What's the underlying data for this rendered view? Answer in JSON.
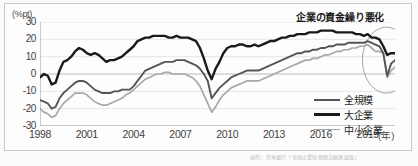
{
  "chart_data": {
    "type": "line",
    "title": "",
    "xlabel": "年",
    "ylabel": "%pt",
    "unit_label": "(%pt)",
    "x_unit_label": "(年)",
    "xlim": [
      1998,
      2020.75
    ],
    "ylim": [
      -30,
      30
    ],
    "ytick_values": [
      30,
      20,
      10,
      0,
      -10,
      -20,
      -30
    ],
    "ytick_labels": [
      "30",
      "20",
      "10",
      "0",
      "-10",
      "-20",
      "-30"
    ],
    "xtick_values": [
      1998,
      2001,
      2004,
      2007,
      2010,
      2013,
      2016,
      2019
    ],
    "xtick_labels": [
      "1998",
      "2001",
      "2004",
      "2007",
      "2010",
      "2013",
      "2016",
      "2019"
    ],
    "grid": true,
    "grid_axis": "y",
    "legend_position": "bottom-right",
    "annotations": [
      {
        "text": "企業の資金繰り悪化",
        "type": "ellipse-callout",
        "target_x": 2020.2,
        "target_y": 8
      }
    ],
    "series": [
      {
        "name": "全規模",
        "color": "#555555",
        "width": 1.9,
        "x": [
          1998.0,
          1998.25,
          1998.5,
          1998.75,
          1999.0,
          1999.25,
          1999.5,
          1999.75,
          2000.0,
          2000.25,
          2000.5,
          2000.75,
          2001.0,
          2001.25,
          2001.5,
          2001.75,
          2002.0,
          2002.25,
          2002.5,
          2002.75,
          2003.0,
          2003.25,
          2003.5,
          2003.75,
          2004.0,
          2004.25,
          2004.5,
          2004.75,
          2005.0,
          2005.25,
          2005.5,
          2005.75,
          2006.0,
          2006.25,
          2006.5,
          2006.75,
          2007.0,
          2007.25,
          2007.5,
          2007.75,
          2008.0,
          2008.25,
          2008.5,
          2008.75,
          2009.0,
          2009.25,
          2009.5,
          2009.75,
          2010.0,
          2010.25,
          2010.5,
          2010.75,
          2011.0,
          2011.25,
          2011.5,
          2011.75,
          2012.0,
          2012.25,
          2012.5,
          2012.75,
          2013.0,
          2013.25,
          2013.5,
          2013.75,
          2014.0,
          2014.25,
          2014.5,
          2014.75,
          2015.0,
          2015.25,
          2015.5,
          2015.75,
          2016.0,
          2016.25,
          2016.5,
          2016.75,
          2017.0,
          2017.25,
          2017.5,
          2017.75,
          2018.0,
          2018.25,
          2018.5,
          2018.75,
          2019.0,
          2019.25,
          2019.5,
          2019.75,
          2020.0,
          2020.25,
          2020.5,
          2020.75
        ],
        "y": [
          -15,
          -16,
          -17,
          -20,
          -19,
          -14,
          -11,
          -9,
          -7,
          -5,
          -4,
          -4,
          -5,
          -7,
          -9,
          -10,
          -11,
          -11,
          -11,
          -10,
          -10,
          -9,
          -9,
          -9,
          -7,
          -4,
          -1,
          2,
          3,
          4,
          5,
          6,
          7,
          7,
          7,
          8,
          8,
          8,
          7,
          6,
          5,
          3,
          0,
          -4,
          -14,
          -11,
          -8,
          -6,
          -4,
          -2,
          -1,
          0,
          1,
          2,
          2,
          2,
          2,
          3,
          4,
          5,
          6,
          7,
          8,
          9,
          10,
          11,
          12,
          12,
          13,
          13,
          14,
          14,
          15,
          15,
          16,
          16,
          17,
          17,
          17,
          18,
          18,
          18,
          18,
          18,
          19,
          18,
          17,
          16,
          12,
          -1,
          6,
          8
        ]
      },
      {
        "name": "大企業",
        "color": "#1a1a1a",
        "width": 2.4,
        "x": [
          1998.0,
          1998.25,
          1998.5,
          1998.75,
          1999.0,
          1999.25,
          1999.5,
          1999.75,
          2000.0,
          2000.25,
          2000.5,
          2000.75,
          2001.0,
          2001.25,
          2001.5,
          2001.75,
          2002.0,
          2002.25,
          2002.5,
          2002.75,
          2003.0,
          2003.25,
          2003.5,
          2003.75,
          2004.0,
          2004.25,
          2004.5,
          2004.75,
          2005.0,
          2005.25,
          2005.5,
          2005.75,
          2006.0,
          2006.25,
          2006.5,
          2006.75,
          2007.0,
          2007.25,
          2007.5,
          2007.75,
          2008.0,
          2008.25,
          2008.5,
          2008.75,
          2009.0,
          2009.25,
          2009.5,
          2009.75,
          2010.0,
          2010.25,
          2010.5,
          2010.75,
          2011.0,
          2011.25,
          2011.5,
          2011.75,
          2012.0,
          2012.25,
          2012.5,
          2012.75,
          2013.0,
          2013.25,
          2013.5,
          2013.75,
          2014.0,
          2014.25,
          2014.5,
          2014.75,
          2015.0,
          2015.25,
          2015.5,
          2015.75,
          2016.0,
          2016.25,
          2016.5,
          2016.75,
          2017.0,
          2017.25,
          2017.5,
          2017.75,
          2018.0,
          2018.25,
          2018.5,
          2018.75,
          2019.0,
          2019.25,
          2019.5,
          2019.75,
          2020.0,
          2020.25,
          2020.5,
          2020.75
        ],
        "y": [
          -2,
          0,
          -1,
          -6,
          -5,
          2,
          7,
          8,
          10,
          13,
          15,
          14,
          12,
          11,
          12,
          11,
          9,
          7,
          8,
          8,
          9,
          10,
          12,
          14,
          16,
          19,
          20,
          21,
          21,
          22,
          22,
          22,
          22,
          21,
          21,
          22,
          21,
          21,
          21,
          20,
          19,
          15,
          9,
          2,
          -3,
          3,
          7,
          12,
          15,
          16,
          16,
          17,
          17,
          16,
          16,
          17,
          16,
          17,
          18,
          19,
          19,
          20,
          21,
          21,
          22,
          22,
          23,
          23,
          23,
          24,
          24,
          24,
          25,
          25,
          25,
          25,
          24,
          24,
          24,
          24,
          24,
          23,
          23,
          22,
          23,
          21,
          21,
          20,
          16,
          11,
          12,
          12
        ]
      },
      {
        "name": "中小企業",
        "color": "#a8a8a8",
        "width": 1.7,
        "x": [
          1998.0,
          1998.25,
          1998.5,
          1998.75,
          1999.0,
          1999.25,
          1999.5,
          1999.75,
          2000.0,
          2000.25,
          2000.5,
          2000.75,
          2001.0,
          2001.25,
          2001.5,
          2001.75,
          2002.0,
          2002.25,
          2002.5,
          2002.75,
          2003.0,
          2003.25,
          2003.5,
          2003.75,
          2004.0,
          2004.25,
          2004.5,
          2004.75,
          2005.0,
          2005.25,
          2005.5,
          2005.75,
          2006.0,
          2006.25,
          2006.5,
          2006.75,
          2007.0,
          2007.25,
          2007.5,
          2007.75,
          2008.0,
          2008.25,
          2008.5,
          2008.75,
          2009.0,
          2009.25,
          2009.5,
          2009.75,
          2010.0,
          2010.25,
          2010.5,
          2010.75,
          2011.0,
          2011.25,
          2011.5,
          2011.75,
          2012.0,
          2012.25,
          2012.5,
          2012.75,
          2013.0,
          2013.25,
          2013.5,
          2013.75,
          2014.0,
          2014.25,
          2014.5,
          2014.75,
          2015.0,
          2015.25,
          2015.5,
          2015.75,
          2016.0,
          2016.25,
          2016.5,
          2016.75,
          2017.0,
          2017.25,
          2017.5,
          2017.75,
          2018.0,
          2018.25,
          2018.5,
          2018.75,
          2019.0,
          2019.25,
          2019.5,
          2019.75,
          2020.0,
          2020.25,
          2020.5,
          2020.75
        ],
        "y": [
          -20,
          -22,
          -23,
          -25,
          -24,
          -20,
          -17,
          -15,
          -13,
          -11,
          -11,
          -11,
          -12,
          -14,
          -16,
          -17,
          -18,
          -18,
          -17,
          -16,
          -15,
          -14,
          -12,
          -11,
          -9,
          -7,
          -5,
          -3,
          -2,
          -1,
          0,
          0,
          1,
          1,
          0,
          0,
          0,
          0,
          -1,
          -2,
          -4,
          -7,
          -12,
          -17,
          -22,
          -19,
          -15,
          -12,
          -10,
          -8,
          -7,
          -6,
          -5,
          -4,
          -4,
          -4,
          -4,
          -3,
          -2,
          -1,
          0,
          1,
          2,
          3,
          4,
          5,
          6,
          7,
          8,
          8,
          9,
          9,
          10,
          11,
          11,
          12,
          13,
          13,
          14,
          14,
          15,
          15,
          16,
          16,
          17,
          15,
          13,
          13,
          12,
          -2,
          2,
          4
        ]
      }
    ]
  },
  "legend": {
    "items": [
      {
        "label": "全規模",
        "color": "#555555",
        "width": 2
      },
      {
        "label": "大企業",
        "color": "#1a1a1a",
        "width": 3
      },
      {
        "label": "中小企業",
        "color": "#a8a8a8",
        "width": 1.6
      }
    ]
  },
  "source_note": "出所：日本銀行「全国企業短期経済観測調査」"
}
